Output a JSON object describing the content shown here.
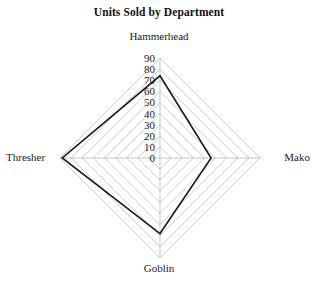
{
  "chart_data": {
    "type": "radar",
    "title": "Units Sold by Department",
    "categories": [
      "Hammerhead",
      "Mako",
      "Goblin",
      "Thresher"
    ],
    "values": [
      74,
      46,
      68,
      88
    ],
    "series": [
      {
        "name": "Units Sold",
        "values": [
          74,
          46,
          68,
          88
        ]
      }
    ],
    "tick_labels": [
      "0",
      "10",
      "20",
      "30",
      "40",
      "50",
      "60",
      "70",
      "80",
      "90"
    ],
    "rlim": [
      0,
      90
    ],
    "rtick_step": 10,
    "grid": true,
    "grid_shape": "polygon",
    "legend": false,
    "legend_position": "none",
    "xlabel": "",
    "ylabel": "",
    "colors": {
      "background": "#ffffff",
      "grid": "#b3b3b3",
      "spoke": "#b0b0b0",
      "series_line": "#1a1a1a",
      "text": "#1a1a1a"
    },
    "geometry": {
      "center_x": 160,
      "center_y": 158,
      "radius": 100
    }
  },
  "axis_labels": {
    "top": "Hammerhead",
    "right": "Mako",
    "bottom": "Goblin",
    "left": "Thresher"
  },
  "ticks": {
    "t0": "0",
    "t1": "10",
    "t2": "20",
    "t3": "30",
    "t4": "40",
    "t5": "50",
    "t6": "60",
    "t7": "70",
    "t8": "80",
    "t9": "90"
  }
}
